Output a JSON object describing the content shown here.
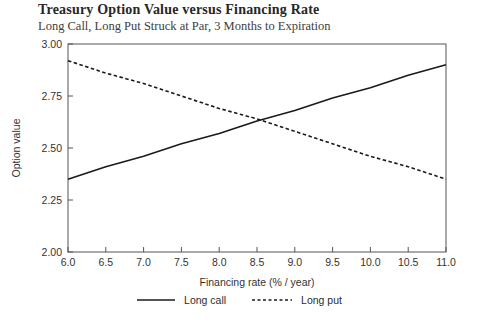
{
  "chart": {
    "title": "Treasury Option Value versus Financing Rate",
    "subtitle": "Long Call, Long Put Struck at Par, 3 Months to Expiration"
  },
  "chart_data": {
    "type": "line",
    "title": "Treasury Option Value versus Financing Rate",
    "subtitle": "Long Call, Long Put Struck at Par, 3 Months to Expiration",
    "xlabel": "Financing rate (% / year)",
    "ylabel": "Option value",
    "xlim": [
      6.0,
      11.0
    ],
    "ylim": [
      2.0,
      3.0
    ],
    "x_tick_labels": [
      "6.0",
      "6.5",
      "7.0",
      "7.5",
      "8.0",
      "8.5",
      "9.0",
      "9.5",
      "10.0",
      "10.5",
      "11.0"
    ],
    "x_tick_values": [
      6.0,
      6.5,
      7.0,
      7.5,
      8.0,
      8.5,
      9.0,
      9.5,
      10.0,
      10.5,
      11.0
    ],
    "y_tick_labels": [
      "2.00",
      "2.25",
      "2.50",
      "2.75",
      "3.00"
    ],
    "y_tick_values": [
      2.0,
      2.25,
      2.5,
      2.75,
      3.0
    ],
    "x": [
      6.0,
      6.5,
      7.0,
      7.5,
      8.0,
      8.5,
      9.0,
      9.5,
      10.0,
      10.5,
      11.0
    ],
    "series": [
      {
        "name": "Long call",
        "style": "solid",
        "values": [
          2.35,
          2.41,
          2.46,
          2.52,
          2.57,
          2.63,
          2.68,
          2.74,
          2.79,
          2.85,
          2.9
        ]
      },
      {
        "name": "Long put",
        "style": "dashed",
        "values": [
          2.92,
          2.86,
          2.81,
          2.75,
          2.69,
          2.64,
          2.58,
          2.52,
          2.46,
          2.41,
          2.35
        ]
      }
    ],
    "grid": false,
    "legend_position": "bottom-center",
    "frame": "full-box",
    "tick_direction": "in"
  },
  "colors": {
    "background": "#ffffff",
    "frame": "#555555",
    "line": "#1a1a1a",
    "tick_text": "#333333",
    "title_text": "#272727",
    "subtitle_text": "#3d3d3d"
  }
}
